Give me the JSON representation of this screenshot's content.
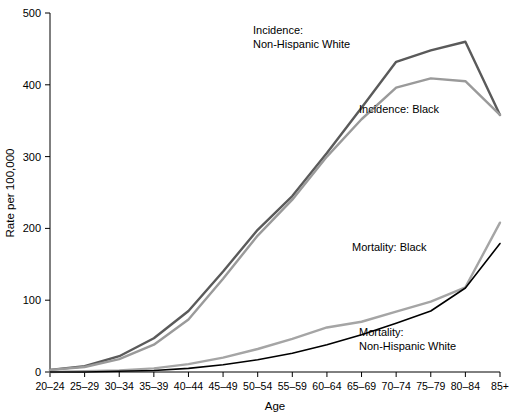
{
  "chart_data": {
    "type": "line",
    "title": "",
    "xlabel": "Age",
    "ylabel": "Rate per 100,000",
    "ylim": [
      0,
      500
    ],
    "yticks": [
      0,
      100,
      200,
      300,
      400,
      500
    ],
    "ytick_labels": [
      "0",
      "100",
      "200",
      "300",
      "400",
      "500"
    ],
    "grid": false,
    "legend_position": "inline-annotations",
    "categories": [
      "20–24",
      "25–29",
      "30–34",
      "35–39",
      "40–44",
      "45–49",
      "50–54",
      "55–59",
      "60–64",
      "65–69",
      "70–74",
      "75–79",
      "80–84",
      "85+"
    ],
    "series": [
      {
        "name": "Incidence: Non-Hispanic White",
        "color": "#5a5a5a",
        "values": [
          3,
          8,
          22,
          47,
          85,
          140,
          198,
          245,
          305,
          368,
          432,
          448,
          460,
          358
        ]
      },
      {
        "name": "Incidence: Black",
        "color": "#9a9a9a",
        "values": [
          3,
          7,
          18,
          38,
          73,
          130,
          190,
          240,
          300,
          352,
          396,
          409,
          405,
          358
        ]
      },
      {
        "name": "Mortality: Black",
        "color": "#a5a5a5",
        "values": [
          0,
          1,
          2,
          5,
          11,
          20,
          32,
          46,
          62,
          70,
          84,
          98,
          118,
          208
        ]
      },
      {
        "name": "Mortality: Non-Hispanic White",
        "color": "#000000",
        "values": [
          0,
          0,
          1,
          2,
          5,
          10,
          17,
          26,
          38,
          52,
          68,
          85,
          117,
          179
        ]
      }
    ],
    "annotations": [
      {
        "id": "ann-incidence-nhw",
        "lines": [
          "Incidence:",
          "Non-Hispanic White"
        ],
        "x": 253,
        "y": 34
      },
      {
        "id": "ann-incidence-black",
        "lines": [
          "Incidence: Black"
        ],
        "x": 359,
        "y": 113
      },
      {
        "id": "ann-mortality-black",
        "lines": [
          "Mortality: Black"
        ],
        "x": 352,
        "y": 251
      },
      {
        "id": "ann-mortality-nhw",
        "lines": [
          "Mortality:",
          "Non-Hispanic White"
        ],
        "x": 359,
        "y": 336
      }
    ]
  },
  "plot_geometry": {
    "left": 50,
    "right": 500,
    "top": 13,
    "bottom": 372
  }
}
